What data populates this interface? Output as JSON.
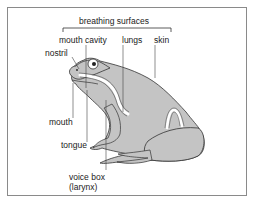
{
  "diagram": {
    "bracket_label": "breathing surfaces",
    "labels": {
      "mouth_cavity": "mouth cavity",
      "lungs": "lungs",
      "skin": "skin",
      "nostril": "nostril",
      "mouth": "mouth",
      "tongue": "tongue",
      "voice_box_line1": "voice box",
      "voice_box_line2": "(larynx)"
    },
    "colors": {
      "body_fill": "#c4c4c4",
      "outline": "#333333",
      "airway": "#ffffff",
      "border": "#8a8a8a",
      "text": "#222222"
    }
  }
}
